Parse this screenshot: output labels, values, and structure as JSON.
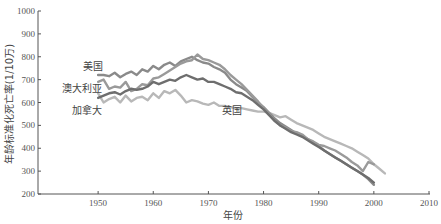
{
  "chart_data": {
    "type": "line",
    "title": "",
    "xlabel": "年份",
    "ylabel": "年龄标准化死亡率(1/10万)",
    "xlim": [
      1939,
      2010
    ],
    "ylim": [
      200,
      1000
    ],
    "xticks": [
      1950,
      1960,
      1970,
      1980,
      1990,
      2000,
      2010
    ],
    "yticks": [
      200,
      300,
      400,
      500,
      600,
      700,
      800,
      900,
      1000
    ],
    "grid": false,
    "legend": "inline-labels",
    "series": [
      {
        "name": "美国",
        "color": "#8a8a8a",
        "x": [
          1950,
          1951,
          1952,
          1953,
          1954,
          1955,
          1956,
          1957,
          1958,
          1959,
          1960,
          1961,
          1962,
          1963,
          1964,
          1965,
          1966,
          1967,
          1968,
          1969,
          1970,
          1971,
          1972,
          1973,
          1974,
          1975,
          1976,
          1977,
          1978,
          1979,
          1980,
          1981,
          1982,
          1983,
          1984,
          1985,
          1986,
          1987,
          1988,
          1989,
          1990,
          1991,
          1992,
          1993,
          1994,
          1995,
          1996,
          1997,
          1998,
          1999,
          2000
        ],
        "y": [
          720,
          720,
          715,
          730,
          710,
          725,
          735,
          720,
          745,
          735,
          760,
          745,
          765,
          775,
          760,
          780,
          790,
          800,
          785,
          775,
          770,
          755,
          745,
          730,
          700,
          680,
          665,
          650,
          625,
          600,
          580,
          555,
          530,
          510,
          495,
          480,
          465,
          455,
          440,
          425,
          410,
          390,
          375,
          360,
          345,
          330,
          315,
          300,
          285,
          265,
          240
        ]
      },
      {
        "name": "澳大利亚",
        "color": "#9a9a9a",
        "x": [
          1950,
          1951,
          1952,
          1953,
          1954,
          1955,
          1956,
          1957,
          1958,
          1959,
          1960,
          1961,
          1962,
          1963,
          1964,
          1965,
          1966,
          1967,
          1968,
          1969,
          1970,
          1971,
          1972,
          1973,
          1974,
          1975,
          1976,
          1977,
          1978,
          1979,
          1980,
          1981,
          1982,
          1983,
          1984,
          1985,
          1986,
          1987,
          1988,
          1989,
          1990,
          1991,
          1992,
          1993,
          1994,
          1995,
          1996,
          1997,
          1998,
          1999,
          2000
        ],
        "y": [
          690,
          700,
          660,
          670,
          665,
          690,
          650,
          660,
          680,
          675,
          705,
          710,
          725,
          740,
          755,
          770,
          780,
          785,
          810,
          790,
          785,
          775,
          765,
          745,
          720,
          700,
          680,
          655,
          630,
          605,
          575,
          550,
          520,
          500,
          490,
          475,
          470,
          460,
          440,
          430,
          415,
          410,
          400,
          390,
          375,
          360,
          340,
          325,
          300,
          340,
          330
        ]
      },
      {
        "name": "加拿大",
        "color": "#6e6e6e",
        "x": [
          1950,
          1951,
          1952,
          1953,
          1954,
          1955,
          1956,
          1957,
          1958,
          1959,
          1960,
          1961,
          1962,
          1963,
          1964,
          1965,
          1966,
          1967,
          1968,
          1969,
          1970,
          1971,
          1972,
          1973,
          1974,
          1975,
          1976,
          1977,
          1978,
          1979,
          1980,
          1981,
          1982,
          1983,
          1984,
          1985,
          1986,
          1987,
          1988,
          1989,
          1990,
          1991,
          1992,
          1993,
          1994,
          1995,
          1996,
          1997,
          1998,
          1999,
          2000
        ],
        "y": [
          620,
          630,
          640,
          645,
          635,
          650,
          660,
          655,
          660,
          670,
          690,
          680,
          690,
          700,
          695,
          710,
          720,
          710,
          700,
          705,
          690,
          690,
          680,
          670,
          660,
          645,
          640,
          625,
          610,
          590,
          570,
          545,
          520,
          500,
          485,
          470,
          460,
          450,
          435,
          420,
          405,
          390,
          375,
          360,
          345,
          330,
          315,
          300,
          285,
          270,
          250
        ]
      },
      {
        "name": "英国",
        "color": "#b8b8b8",
        "x": [
          1950,
          1951,
          1952,
          1953,
          1954,
          1955,
          1956,
          1957,
          1958,
          1959,
          1960,
          1961,
          1962,
          1963,
          1964,
          1965,
          1966,
          1967,
          1968,
          1969,
          1970,
          1971,
          1972,
          1973,
          1974,
          1975,
          1976,
          1977,
          1978,
          1979,
          1980,
          1981,
          1982,
          1983,
          1984,
          1985,
          1986,
          1987,
          1988,
          1989,
          1990,
          1991,
          1992,
          1993,
          1994,
          1995,
          1996,
          1997,
          1998,
          1999,
          2000,
          2001,
          2002
        ],
        "y": [
          640,
          600,
          615,
          625,
          600,
          630,
          605,
          620,
          625,
          610,
          640,
          620,
          650,
          640,
          655,
          630,
          600,
          610,
          605,
          595,
          590,
          600,
          585,
          585,
          580,
          575,
          575,
          570,
          565,
          560,
          560,
          555,
          545,
          535,
          540,
          525,
          510,
          500,
          490,
          480,
          465,
          450,
          440,
          430,
          420,
          410,
          400,
          385,
          370,
          355,
          330,
          310,
          290
        ]
      }
    ],
    "annotations": [
      {
        "text": "美国",
        "series": "美国"
      },
      {
        "text": "澳大利亚",
        "series": "澳大利亚"
      },
      {
        "text": "加拿大",
        "series": "加拿大"
      },
      {
        "text": "英国",
        "series": "英国"
      }
    ]
  }
}
